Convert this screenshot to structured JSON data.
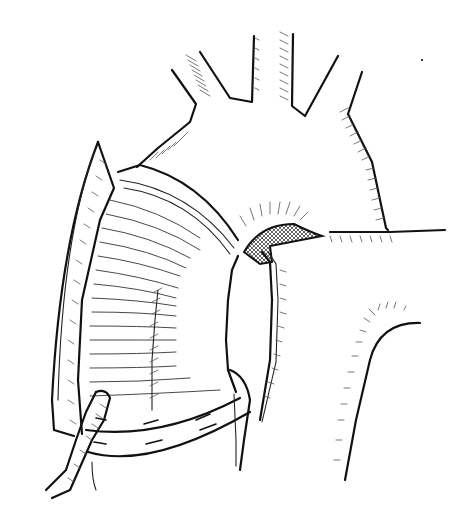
{
  "figure": {
    "stroke_color": "#111111",
    "background": "#ffffff"
  }
}
